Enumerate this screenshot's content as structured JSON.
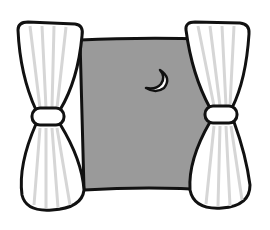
{
  "scene": {
    "description": "Night window with tied-back curtains and crescent moon",
    "colors": {
      "background": "#ffffff",
      "sky": "#9a9a9a",
      "outline": "#111111",
      "curtain": "#ffffff",
      "curtain_stripes": "#d6d6d6",
      "moon": "#ffffff"
    }
  }
}
